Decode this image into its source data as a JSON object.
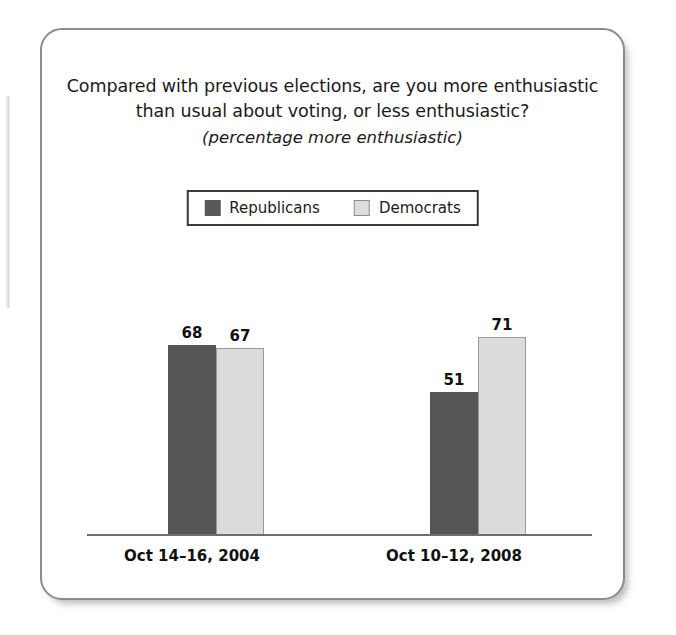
{
  "figure": {
    "title_lines": [
      "Compared with previous elections, are you more enthusiastic",
      "than usual about voting, or less enthusiastic?"
    ],
    "subtitle": "(percentage more enthusiastic)"
  },
  "colors": {
    "republican": "#555555",
    "democrat": "#dcdcdc",
    "axis": "#6e6e6e",
    "card_border": "#8c8c8c",
    "text": "#111111"
  },
  "chart_data": {
    "type": "bar",
    "title": "Compared with previous elections, are you more enthusiastic than usual about voting, or less enthusiastic?",
    "subtitle": "(percentage more enthusiastic)",
    "xlabel": "",
    "ylabel": "",
    "ylim": [
      0,
      82
    ],
    "grid": false,
    "legend_position": "top-center",
    "categories": [
      "Oct 14–16, 2004",
      "Oct 10–12, 2008"
    ],
    "series": [
      {
        "name": "Republicans",
        "color": "#555555",
        "values": [
          68,
          51
        ]
      },
      {
        "name": "Democrats",
        "color": "#dcdcdc",
        "values": [
          67,
          71
        ]
      }
    ],
    "bars": [
      {
        "group": 0,
        "series": "Republicans",
        "value": 68,
        "label": "68"
      },
      {
        "group": 0,
        "series": "Democrats",
        "value": 67,
        "label": "67"
      },
      {
        "group": 1,
        "series": "Republicans",
        "value": 51,
        "label": "51"
      },
      {
        "group": 1,
        "series": "Democrats",
        "value": 71,
        "label": "71"
      }
    ]
  }
}
